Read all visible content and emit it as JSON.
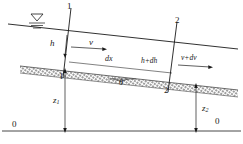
{
  "figure": {
    "width": 243,
    "height": 144,
    "line_color": "#1a1a1a",
    "hatch_color": "#6b6b6b"
  },
  "labels": {
    "section_1_top": "1",
    "section_1_bottom": "1",
    "section_2_top": "2",
    "section_2_bottom": "2",
    "depth_upstream": "h",
    "velocity_upstream": "v",
    "depth_downstream": "h+dh",
    "velocity_downstream": "v+dv",
    "length_element": "dx",
    "bed_angle": "θ",
    "elevation_upstream": "z",
    "elevation_upstream_sub": "1",
    "elevation_downstream": "z",
    "elevation_downstream_sub": "2",
    "datum_left": "0",
    "datum_right": "0"
  },
  "symbols": {
    "free_surface_marker": "free-surface-triangle-icon"
  }
}
